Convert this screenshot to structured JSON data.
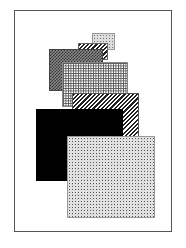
{
  "figure": {
    "shapes": [
      {
        "name": "small-speckled-rect",
        "pattern": "speckle",
        "color": "#dddddd"
      },
      {
        "name": "small-hatched-rect",
        "pattern": "diagonal-hatch",
        "color": "#222222"
      },
      {
        "name": "dark-checker-rect",
        "pattern": "checker",
        "color": "#555555"
      },
      {
        "name": "grid-rect",
        "pattern": "grid",
        "color": "#555555"
      },
      {
        "name": "wide-hatched-rect",
        "pattern": "diagonal-hatch",
        "color": "#222222"
      },
      {
        "name": "black-rect",
        "pattern": "solid",
        "color": "#000000"
      },
      {
        "name": "large-speckled-rect",
        "pattern": "speckle",
        "color": "#c8c8c8"
      }
    ]
  }
}
